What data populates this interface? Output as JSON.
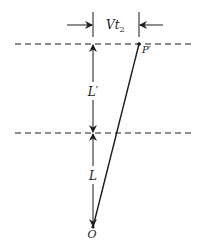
{
  "diagram": {
    "colors": {
      "ink": "#1a1a1a",
      "background": "#ffffff"
    },
    "labels": {
      "horizontal_dimension": "Vt",
      "horizontal_dimension_sub": "2",
      "point_top": "P′",
      "upper_segment": "L′",
      "lower_segment": "L",
      "origin": "O"
    },
    "reference_lines": [
      {
        "name": "upper-dashed-line",
        "y": 44
      },
      {
        "name": "middle-dashed-line",
        "y": 133
      }
    ],
    "points": {
      "O": {
        "x": 93,
        "y": 227
      },
      "P_prime": {
        "x": 139,
        "y": 44
      }
    }
  }
}
